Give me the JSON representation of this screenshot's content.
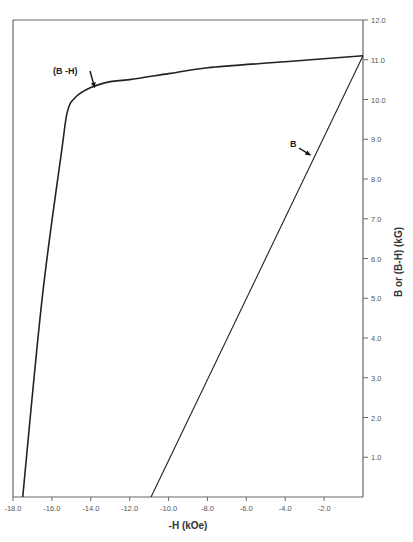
{
  "chart_data": {
    "type": "line",
    "title": "",
    "xlabel": "-H (kOe)",
    "ylabel": "B or (B-H) (kG)",
    "xlim": [
      -18.0,
      0.0
    ],
    "ylim": [
      0.0,
      12.0
    ],
    "grid": false,
    "y_axis_position": "right",
    "x_ticks": [
      -18.0,
      -16.0,
      -14.0,
      -12.0,
      -10.0,
      -8.0,
      -6.0,
      -4.0,
      -2.0
    ],
    "x_tick_labels": [
      "-18.0",
      "-16.0",
      "-14.0",
      "-12.0",
      "-10.0",
      "-8.0",
      "-6.0",
      "-4.0",
      "-2.0"
    ],
    "y_ticks": [
      1.0,
      2.0,
      3.0,
      4.0,
      5.0,
      6.0,
      7.0,
      8.0,
      9.0,
      10.0,
      11.0,
      12.0
    ],
    "y_tick_labels": [
      "1.0",
      "2.0",
      "3.0",
      "4.0",
      "5.0",
      "6.0",
      "7.0",
      "8.0",
      "9.0",
      "10.0",
      "11.0",
      "12.0"
    ],
    "series": [
      {
        "name": "(B -H)",
        "x": [
          -17.5,
          -16.5,
          -15.5,
          -15.2,
          -14.8,
          -14.0,
          -13.0,
          -12.0,
          -10.0,
          -8.0,
          -4.0,
          0.0
        ],
        "y": [
          0.0,
          5.0,
          8.7,
          9.7,
          10.05,
          10.3,
          10.45,
          10.5,
          10.65,
          10.8,
          10.95,
          11.1
        ]
      },
      {
        "name": "B",
        "x": [
          -10.9,
          0.0
        ],
        "y": [
          0.0,
          11.1
        ]
      }
    ],
    "annotations": [
      {
        "text": "(B -H)",
        "arrow_to": [
          -13.8,
          10.3
        ]
      },
      {
        "text": "B",
        "arrow_to": [
          -2.7,
          8.6
        ]
      }
    ]
  }
}
